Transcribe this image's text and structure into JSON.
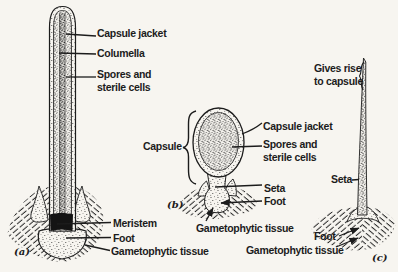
{
  "figure": {
    "paper_color": "#f7f5f0",
    "ink_color": "#1c1c1c"
  },
  "diagram_a": {
    "tag": "(a)",
    "labels": {
      "capsule_jacket": "Capsule jacket",
      "columella": "Columella",
      "spores_sterile": "Spores and\nsterile cells",
      "meristem": "Meristem",
      "foot": "Foot",
      "gametophytic_tissue": "Gametophytic tissue"
    }
  },
  "diagram_b": {
    "tag": "(b)",
    "labels": {
      "capsule": "Capsule",
      "capsule_jacket": "Capsule jacket",
      "spores_sterile": "Spores and\nsterile cells",
      "seta": "Seta",
      "foot": "Foot",
      "gametophytic_tissue": "Gametophytic tissue"
    }
  },
  "diagram_c": {
    "tag": "(c)",
    "labels": {
      "gives_rise": "Gives rise\nto capsule",
      "seta": "Seta",
      "foot": "Foot",
      "gametophytic_tissue": "Gametophytic tissue"
    }
  }
}
